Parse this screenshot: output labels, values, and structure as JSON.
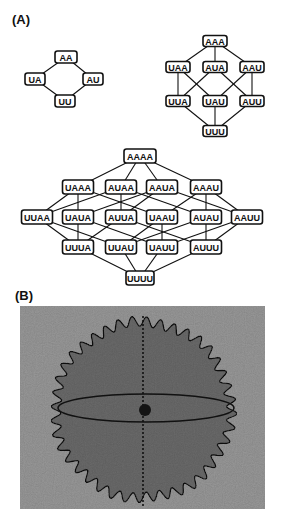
{
  "panel_a": {
    "label": "(A)",
    "lattices": [
      {
        "name": "length-2",
        "nodes": [
          {
            "id": "AA",
            "x": 66,
            "y": 57,
            "w": 22,
            "h": 12
          },
          {
            "id": "UA",
            "x": 35,
            "y": 79,
            "w": 20,
            "h": 12
          },
          {
            "id": "AU",
            "x": 93,
            "y": 79,
            "w": 20,
            "h": 12
          },
          {
            "id": "UU",
            "x": 65,
            "y": 101,
            "w": 20,
            "h": 12
          }
        ],
        "edges": [
          [
            "AA",
            "UA"
          ],
          [
            "AA",
            "AU"
          ],
          [
            "UA",
            "UU"
          ],
          [
            "AU",
            "UU"
          ]
        ]
      },
      {
        "name": "length-3",
        "nodes": [
          {
            "id": "AAA",
            "x": 215,
            "y": 41,
            "w": 24,
            "h": 11
          },
          {
            "id": "UAA",
            "x": 178,
            "y": 67,
            "w": 24,
            "h": 11
          },
          {
            "id": "AUA",
            "x": 215,
            "y": 67,
            "w": 24,
            "h": 11
          },
          {
            "id": "AAU",
            "x": 252,
            "y": 67,
            "w": 24,
            "h": 11
          },
          {
            "id": "UUA",
            "x": 178,
            "y": 101,
            "w": 24,
            "h": 11
          },
          {
            "id": "UAU",
            "x": 215,
            "y": 101,
            "w": 24,
            "h": 11
          },
          {
            "id": "AUU",
            "x": 252,
            "y": 101,
            "w": 24,
            "h": 11
          },
          {
            "id": "UUU",
            "x": 215,
            "y": 131,
            "w": 24,
            "h": 11
          }
        ],
        "edges": [
          [
            "AAA",
            "UAA"
          ],
          [
            "AAA",
            "AUA"
          ],
          [
            "AAA",
            "AAU"
          ],
          [
            "UAA",
            "UUA"
          ],
          [
            "UAA",
            "UAU"
          ],
          [
            "AUA",
            "UUA"
          ],
          [
            "AUA",
            "AUU"
          ],
          [
            "AAU",
            "UAU"
          ],
          [
            "AAU",
            "AUU"
          ],
          [
            "UUA",
            "UUU"
          ],
          [
            "UAU",
            "UUU"
          ],
          [
            "AUU",
            "UUU"
          ]
        ]
      },
      {
        "name": "length-4",
        "nodes": [
          {
            "id": "AAAA",
            "x": 140,
            "y": 156,
            "w": 32,
            "h": 14
          },
          {
            "id": "UAAA",
            "x": 78,
            "y": 187,
            "w": 31,
            "h": 14
          },
          {
            "id": "AUAA",
            "x": 121,
            "y": 187,
            "w": 31,
            "h": 14
          },
          {
            "id": "AAUA",
            "x": 162,
            "y": 187,
            "w": 31,
            "h": 14
          },
          {
            "id": "AAAU",
            "x": 206,
            "y": 187,
            "w": 31,
            "h": 14
          },
          {
            "id": "UUAA",
            "x": 37,
            "y": 217,
            "w": 31,
            "h": 14
          },
          {
            "id": "UAUA",
            "x": 78,
            "y": 217,
            "w": 31,
            "h": 14
          },
          {
            "id": "AUUA",
            "x": 121,
            "y": 217,
            "w": 31,
            "h": 14
          },
          {
            "id": "UAAU",
            "x": 162,
            "y": 217,
            "w": 31,
            "h": 14
          },
          {
            "id": "AUAU",
            "x": 206,
            "y": 217,
            "w": 31,
            "h": 14
          },
          {
            "id": "AAUU",
            "x": 247,
            "y": 217,
            "w": 31,
            "h": 14
          },
          {
            "id": "UUUA",
            "x": 78,
            "y": 247,
            "w": 31,
            "h": 14
          },
          {
            "id": "UUAU",
            "x": 121,
            "y": 247,
            "w": 31,
            "h": 14
          },
          {
            "id": "UAUU",
            "x": 162,
            "y": 247,
            "w": 31,
            "h": 14
          },
          {
            "id": "AUUU",
            "x": 206,
            "y": 247,
            "w": 31,
            "h": 14
          },
          {
            "id": "UUUU",
            "x": 140,
            "y": 278,
            "w": 28,
            "h": 14
          }
        ],
        "edges": [
          [
            "AAAA",
            "UAAA"
          ],
          [
            "AAAA",
            "AUAA"
          ],
          [
            "AAAA",
            "AAUA"
          ],
          [
            "AAAA",
            "AAAU"
          ],
          [
            "UAAA",
            "UUAA"
          ],
          [
            "UAAA",
            "UAUA"
          ],
          [
            "UAAA",
            "UAAU"
          ],
          [
            "AUAA",
            "UUAA"
          ],
          [
            "AUAA",
            "AUUA"
          ],
          [
            "AUAA",
            "AUAU"
          ],
          [
            "AAUA",
            "UAUA"
          ],
          [
            "AAUA",
            "AUUA"
          ],
          [
            "AAUA",
            "AAUU"
          ],
          [
            "AAAU",
            "UAAU"
          ],
          [
            "AAAU",
            "AUAU"
          ],
          [
            "AAAU",
            "AAUU"
          ],
          [
            "UUAA",
            "UUUA"
          ],
          [
            "UUAA",
            "UUAU"
          ],
          [
            "UAUA",
            "UUUA"
          ],
          [
            "UAUA",
            "UAUU"
          ],
          [
            "AUUA",
            "UUUA"
          ],
          [
            "AUUA",
            "AUUU"
          ],
          [
            "UAAU",
            "UUAU"
          ],
          [
            "UAAU",
            "UAUU"
          ],
          [
            "AUAU",
            "UUAU"
          ],
          [
            "AUAU",
            "AUUU"
          ],
          [
            "AAUU",
            "UAUU"
          ],
          [
            "AAUU",
            "AUUU"
          ],
          [
            "UUUA",
            "UUUU"
          ],
          [
            "UUAU",
            "UUUU"
          ],
          [
            "UAUU",
            "UUUU"
          ],
          [
            "AUUU",
            "UUUU"
          ]
        ]
      }
    ]
  },
  "panel_b": {
    "label": "(B)",
    "image": {
      "x": 20,
      "y": 306,
      "w": 245,
      "h": 203
    },
    "colors": {
      "background": "#9c9c9c",
      "disk": "#6d6d6d",
      "outline": "#111111",
      "spot": "#141414"
    },
    "disk": {
      "cx": 143,
      "cy": 410,
      "r": 88,
      "teeth": 40,
      "tooth_amp": 5
    },
    "equator_ellipse": {
      "cx": 146,
      "cy": 408,
      "rx": 88,
      "ry": 14
    },
    "axis_line": {
      "x": 143,
      "y1": 316,
      "y2": 506
    },
    "spot": {
      "cx": 145,
      "cy": 410,
      "r": 6
    }
  }
}
